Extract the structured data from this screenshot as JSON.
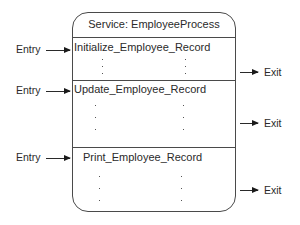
{
  "service": {
    "title": "Service: EmployeeProcess"
  },
  "operations": [
    {
      "name": "Initialize_Employee_Record",
      "entry_label": "Entry",
      "exit_label": "Exit"
    },
    {
      "name": "Update_Employee_Record",
      "entry_label": "Entry",
      "exit_label": "Exit"
    },
    {
      "name": "Print_Employee_Record",
      "entry_label": "Entry",
      "exit_label": "Exit"
    }
  ],
  "colors": {
    "line": "#4a4a4a",
    "text": "#2a2a2a",
    "background": "#ffffff"
  }
}
